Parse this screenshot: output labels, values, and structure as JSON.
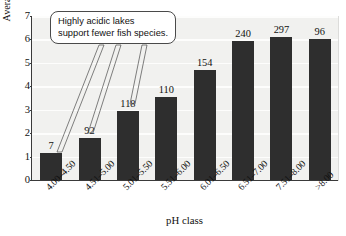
{
  "chart_data": {
    "type": "bar",
    "title": "",
    "xlabel": "pH class",
    "ylabel": "Average number of fish species",
    "categories": [
      "4.00–4.50",
      "4.51–5.00",
      "5.01–5.50",
      "5.51–6.00",
      "6.01–6.50",
      "6.51–7.00",
      "7.51–8.00",
      ">8.00"
    ],
    "values": [
      1.15,
      1.8,
      2.95,
      3.55,
      4.7,
      5.95,
      6.1,
      6.0
    ],
    "point_labels": [
      "7",
      "92",
      "118",
      "110",
      "154",
      "240",
      "297",
      "96"
    ],
    "ylim": [
      0,
      7
    ],
    "yticks": [
      "0",
      "1",
      "2",
      "3",
      "4",
      "5",
      "6",
      "7"
    ],
    "grid": true,
    "legend": "none",
    "bar_color": "#2e2e2e",
    "plot_background": "#f1f1ef",
    "annotations": [
      {
        "name": "acidic-lakes-callout",
        "line1": "Highly acidic lakes",
        "line2": "support fewer fish species.",
        "points_to": [
          "4.00–4.50",
          "4.51–5.00",
          "5.01–5.50"
        ]
      }
    ]
  }
}
